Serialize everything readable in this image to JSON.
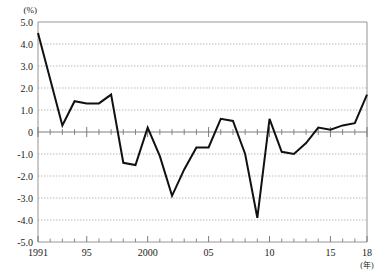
{
  "chart_data": {
    "type": "line",
    "title": "",
    "xlabel": "(年)",
    "ylabel": "(%)",
    "xlim": [
      1991,
      2018
    ],
    "ylim": [
      -5.0,
      5.0
    ],
    "grid": true,
    "legend": "none",
    "y_ticks": [
      "5.0",
      "4.0",
      "3.0",
      "2.0",
      "1.0",
      "0",
      "-1.0",
      "-2.0",
      "-3.0",
      "-4.0",
      "-5.0"
    ],
    "y_tick_values": [
      5.0,
      4.0,
      3.0,
      2.0,
      1.0,
      0,
      -1.0,
      -2.0,
      -3.0,
      -4.0,
      -5.0
    ],
    "x_tick_labels": [
      {
        "value": 1991,
        "label": "1991"
      },
      {
        "value": 1995,
        "label": "95"
      },
      {
        "value": 2000,
        "label": "2000"
      },
      {
        "value": 2005,
        "label": "05"
      },
      {
        "value": 2010,
        "label": "10"
      },
      {
        "value": 2015,
        "label": "15"
      },
      {
        "value": 2018,
        "label": "18"
      }
    ],
    "x": [
      1991,
      1992,
      1993,
      1994,
      1995,
      1996,
      1997,
      1998,
      1999,
      2000,
      2001,
      2002,
      2003,
      2004,
      2005,
      2006,
      2007,
      2008,
      2009,
      2010,
      2011,
      2012,
      2013,
      2014,
      2015,
      2016,
      2017,
      2018
    ],
    "values": [
      4.5,
      2.4,
      0.3,
      1.4,
      1.3,
      1.3,
      1.7,
      -1.4,
      -1.5,
      0.2,
      -1.1,
      -2.9,
      -1.7,
      -0.7,
      -0.7,
      0.6,
      0.5,
      -1.0,
      -3.9,
      0.6,
      -0.9,
      -1.0,
      -0.5,
      0.2,
      0.1,
      0.3,
      0.4,
      1.7
    ],
    "series": [
      {
        "name": "annual-rate",
        "values": [
          4.5,
          2.4,
          0.3,
          1.4,
          1.3,
          1.3,
          1.7,
          -1.4,
          -1.5,
          0.2,
          -1.1,
          -2.9,
          -1.7,
          -0.7,
          -0.7,
          0.6,
          0.5,
          -1.0,
          -3.9,
          0.6,
          -0.9,
          -1.0,
          -0.5,
          0.2,
          0.1,
          0.3,
          0.4,
          1.7
        ],
        "color": "#111111"
      }
    ]
  },
  "colors": {
    "line": "#111111",
    "grid": "#9a9a9a",
    "axis": "#8a8a8a",
    "zero": "#6e6e6e",
    "text": "#1a1a1a",
    "background": "#ffffff"
  }
}
